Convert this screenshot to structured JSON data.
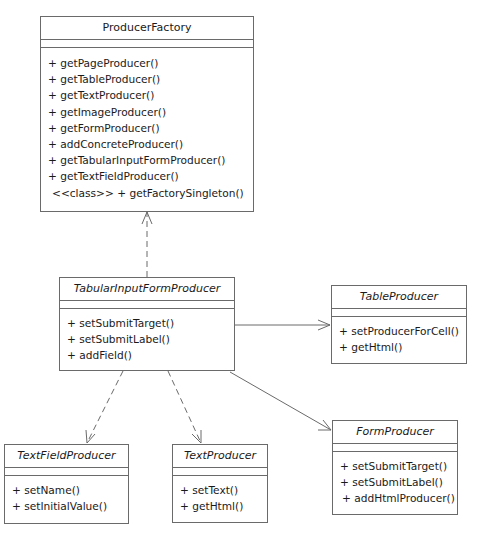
{
  "diagram": {
    "type": "UML class diagram",
    "classes": {
      "producer_factory": {
        "name": "ProducerFactory",
        "abstract": false,
        "operations": [
          "+ getPageProducer()",
          "+ getTableProducer()",
          "+ getTextProducer()",
          "+ getImageProducer()",
          "+ getFormProducer()",
          "+ addConcreteProducer()",
          "+ getTabularInputFormProducer()",
          "+ getTextFieldProducer()",
          "<<class>> + getFactorySingleton()"
        ]
      },
      "tabular_input_form_producer": {
        "name": "TabularInputFormProducer",
        "abstract": true,
        "operations": [
          "+ setSubmitTarget()",
          "+ setSubmitLabel()",
          "+ addField()"
        ]
      },
      "table_producer": {
        "name": "TableProducer",
        "abstract": true,
        "operations": [
          "+ setProducerForCell()",
          "+ getHtml()"
        ]
      },
      "text_field_producer": {
        "name": "TextFieldProducer",
        "abstract": true,
        "operations": [
          "+ setName()",
          "+ setInitialValue()"
        ]
      },
      "text_producer": {
        "name": "TextProducer",
        "abstract": true,
        "operations": [
          "+ setText()",
          "+ getHtml()"
        ]
      },
      "form_producer": {
        "name": "FormProducer",
        "abstract": true,
        "operations": [
          "+ setSubmitTarget()",
          "+ setSubmitLabel()",
          "+ addHtmlProducer()"
        ]
      }
    },
    "relations": [
      {
        "from": "TabularInputFormProducer",
        "to": "ProducerFactory",
        "kind": "dependency",
        "style": "dashed"
      },
      {
        "from": "TabularInputFormProducer",
        "to": "TableProducer",
        "kind": "association",
        "style": "solid"
      },
      {
        "from": "TabularInputFormProducer",
        "to": "TextFieldProducer",
        "kind": "dependency",
        "style": "dashed"
      },
      {
        "from": "TabularInputFormProducer",
        "to": "TextProducer",
        "kind": "dependency",
        "style": "dashed"
      },
      {
        "from": "TabularInputFormProducer",
        "to": "FormProducer",
        "kind": "association",
        "style": "solid"
      }
    ],
    "colors": {
      "line": "#6a6a6a",
      "background": "#ffffff",
      "text": "#1a1a1a"
    }
  }
}
